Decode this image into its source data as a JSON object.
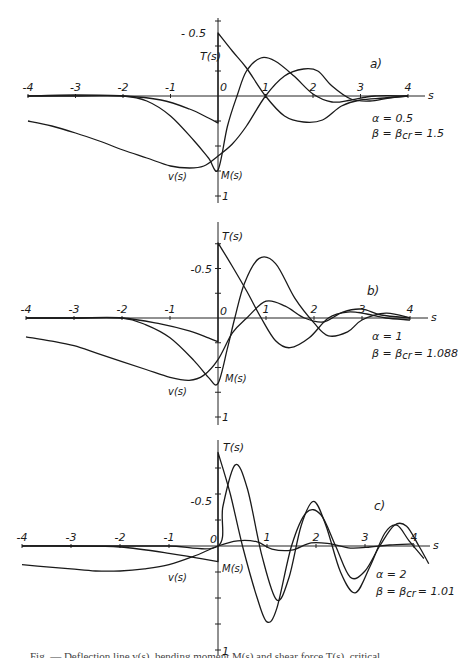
{
  "figure": {
    "caption_partial": "Fig. — Deflection line v(s), bending moment M(s) and shear force T(s), critical"
  },
  "chart_data": [
    {
      "type": "line",
      "panel_label": "a)",
      "xlabel": "s",
      "ylabel": "",
      "x_ticks": [
        "-4",
        "-3",
        "-2",
        "-1",
        "0",
        "1",
        "2",
        "3",
        "4"
      ],
      "y_tick_labels": [
        "-0.5",
        "1"
      ],
      "xlim": [
        -4,
        4.3
      ],
      "ylim": [
        -0.75,
        1.0
      ],
      "y_axis_inverted": true,
      "params": [
        "α = 0.5",
        "β = β_cr = 1.5"
      ],
      "curve_labels": {
        "T": "T(s)",
        "M": "M(s)",
        "v": "v(s)"
      },
      "series": [
        {
          "name": "T(s)",
          "points": [
            [
              -4,
              0.0
            ],
            [
              -3,
              0.0
            ],
            [
              -2,
              0.0
            ],
            [
              -1.2,
              0.04
            ],
            [
              -0.6,
              0.13
            ],
            [
              -0.2,
              0.22
            ],
            [
              0,
              0.27
            ],
            [
              0,
              -0.63
            ],
            [
              0.3,
              -0.45
            ],
            [
              0.6,
              -0.28
            ],
            [
              1.0,
              0.0
            ],
            [
              1.4,
              0.2
            ],
            [
              1.8,
              0.26
            ],
            [
              2.2,
              0.24
            ],
            [
              2.6,
              0.1
            ],
            [
              3.0,
              0.04
            ],
            [
              3.5,
              0.02
            ],
            [
              4.0,
              0.0
            ]
          ]
        },
        {
          "name": "M(s)",
          "points": [
            [
              -4,
              0.0
            ],
            [
              -3,
              -0.01
            ],
            [
              -2,
              0.0
            ],
            [
              -1.5,
              0.05
            ],
            [
              -1.0,
              0.2
            ],
            [
              -0.5,
              0.45
            ],
            [
              -0.2,
              0.62
            ],
            [
              0,
              0.74
            ],
            [
              0.2,
              0.3
            ],
            [
              0.4,
              0.0
            ],
            [
              0.6,
              -0.25
            ],
            [
              0.9,
              -0.38
            ],
            [
              1.2,
              -0.35
            ],
            [
              1.6,
              -0.2
            ],
            [
              2.0,
              -0.02
            ],
            [
              2.4,
              0.06
            ],
            [
              2.8,
              0.04
            ],
            [
              3.3,
              0.0
            ],
            [
              4.0,
              0.0
            ]
          ]
        },
        {
          "name": "v(s)",
          "points": [
            [
              -4,
              0.25
            ],
            [
              -3.5,
              0.3
            ],
            [
              -3,
              0.37
            ],
            [
              -2.5,
              0.45
            ],
            [
              -2,
              0.54
            ],
            [
              -1.5,
              0.62
            ],
            [
              -1,
              0.7
            ],
            [
              -0.6,
              0.72
            ],
            [
              -0.3,
              0.7
            ],
            [
              0,
              0.6
            ],
            [
              0.3,
              0.48
            ],
            [
              0.6,
              0.3
            ],
            [
              1.0,
              0.0
            ],
            [
              1.4,
              -0.2
            ],
            [
              1.8,
              -0.27
            ],
            [
              2.1,
              -0.25
            ],
            [
              2.4,
              -0.1
            ],
            [
              2.8,
              0.03
            ],
            [
              3.2,
              0.05
            ],
            [
              3.6,
              0.02
            ],
            [
              4.0,
              0.0
            ]
          ]
        }
      ]
    },
    {
      "type": "line",
      "panel_label": "b)",
      "xlabel": "s",
      "ylabel": "",
      "x_ticks": [
        "-4",
        "-3",
        "-2",
        "-1",
        "0",
        "1",
        "2",
        "3",
        "4"
      ],
      "y_tick_labels": [
        "-0.5",
        "1"
      ],
      "xlim": [
        -4,
        4.3
      ],
      "ylim": [
        -0.9,
        1.0
      ],
      "y_axis_inverted": true,
      "params": [
        "α = 1",
        "β = β_cr = 1.088"
      ],
      "curve_labels": {
        "T": "T(s)",
        "M": "M(s)",
        "v": "v(s)"
      },
      "series": [
        {
          "name": "T(s)",
          "points": [
            [
              -4,
              0.0
            ],
            [
              -3,
              0.0
            ],
            [
              -2,
              0.0
            ],
            [
              -1.2,
              0.06
            ],
            [
              -0.6,
              0.13
            ],
            [
              -0.2,
              0.2
            ],
            [
              0,
              0.24
            ],
            [
              0,
              -0.76
            ],
            [
              0.3,
              -0.52
            ],
            [
              0.6,
              -0.27
            ],
            [
              0.9,
              0.0
            ],
            [
              1.2,
              0.23
            ],
            [
              1.5,
              0.3
            ],
            [
              1.9,
              0.2
            ],
            [
              2.3,
              0.0
            ],
            [
              2.7,
              -0.06
            ],
            [
              3.1,
              -0.04
            ],
            [
              3.5,
              0.0
            ],
            [
              4.0,
              0.02
            ]
          ]
        },
        {
          "name": "M(s)",
          "points": [
            [
              -4,
              0.0
            ],
            [
              -3,
              0.0
            ],
            [
              -2,
              0.0
            ],
            [
              -1.5,
              0.07
            ],
            [
              -1.0,
              0.2
            ],
            [
              -0.5,
              0.43
            ],
            [
              -0.2,
              0.6
            ],
            [
              0,
              0.66
            ],
            [
              0.2,
              0.3
            ],
            [
              0.35,
              0.0
            ],
            [
              0.55,
              -0.35
            ],
            [
              0.85,
              -0.6
            ],
            [
              1.2,
              -0.55
            ],
            [
              1.6,
              -0.2
            ],
            [
              2.0,
              0.05
            ],
            [
              2.3,
              0.18
            ],
            [
              2.7,
              0.14
            ],
            [
              3.0,
              0.02
            ],
            [
              3.5,
              -0.05
            ],
            [
              4.0,
              0.0
            ]
          ]
        },
        {
          "name": "v(s)",
          "points": [
            [
              -4,
              0.19
            ],
            [
              -3.5,
              0.23
            ],
            [
              -3,
              0.28
            ],
            [
              -2.5,
              0.36
            ],
            [
              -2,
              0.44
            ],
            [
              -1.5,
              0.52
            ],
            [
              -1,
              0.6
            ],
            [
              -0.6,
              0.63
            ],
            [
              -0.3,
              0.58
            ],
            [
              0,
              0.42
            ],
            [
              0.3,
              0.15
            ],
            [
              0.6,
              0.0
            ],
            [
              1.0,
              -0.17
            ],
            [
              1.4,
              -0.12
            ],
            [
              1.8,
              0.0
            ],
            [
              2.2,
              0.04
            ],
            [
              2.6,
              -0.06
            ],
            [
              3.0,
              -0.09
            ],
            [
              3.4,
              -0.03
            ],
            [
              4.0,
              0.0
            ]
          ]
        }
      ]
    },
    {
      "type": "line",
      "panel_label": "c)",
      "xlabel": "s",
      "ylabel": "",
      "x_ticks": [
        "-4",
        "-3",
        "-2",
        "-1",
        "0",
        "1",
        "2",
        "3",
        "4"
      ],
      "y_tick_labels": [
        "-0.5",
        "1"
      ],
      "xlim": [
        -4,
        4.3
      ],
      "ylim": [
        -0.95,
        1.0
      ],
      "y_axis_inverted": true,
      "params": [
        "α = 2",
        "β = β_cr = 1.01"
      ],
      "curve_labels": {
        "T": "T(s)",
        "M": "M(s)",
        "v": "v(s)"
      },
      "series": [
        {
          "name": "T(s)",
          "points": [
            [
              -4,
              0.0
            ],
            [
              -3,
              0.0
            ],
            [
              -2,
              0.01
            ],
            [
              -1,
              0.07
            ],
            [
              -0.5,
              0.11
            ],
            [
              0,
              0.15
            ],
            [
              0,
              -0.9
            ],
            [
              0.25,
              -0.5
            ],
            [
              0.5,
              0.0
            ],
            [
              0.8,
              0.5
            ],
            [
              1.0,
              0.73
            ],
            [
              1.2,
              0.6
            ],
            [
              1.5,
              0.0
            ],
            [
              1.8,
              -0.32
            ],
            [
              2.1,
              -0.3
            ],
            [
              2.4,
              0.0
            ],
            [
              2.7,
              0.3
            ],
            [
              3.0,
              0.24
            ],
            [
              3.3,
              0.0
            ],
            [
              3.6,
              -0.2
            ],
            [
              3.85,
              -0.19
            ],
            [
              4.1,
              0.0
            ],
            [
              4.3,
              0.17
            ]
          ]
        },
        {
          "name": "M(s)",
          "points": [
            [
              -4,
              0.0
            ],
            [
              -3,
              0.0
            ],
            [
              -2,
              0.0
            ],
            [
              -1,
              0.0
            ],
            [
              0,
              0.0
            ],
            [
              0.1,
              -0.38
            ],
            [
              0.35,
              -0.78
            ],
            [
              0.6,
              -0.55
            ],
            [
              0.9,
              0.1
            ],
            [
              1.2,
              0.52
            ],
            [
              1.45,
              0.3
            ],
            [
              1.7,
              -0.2
            ],
            [
              1.95,
              -0.43
            ],
            [
              2.2,
              -0.2
            ],
            [
              2.5,
              0.25
            ],
            [
              2.8,
              0.45
            ],
            [
              3.1,
              0.2
            ],
            [
              3.4,
              -0.12
            ],
            [
              3.65,
              -0.2
            ],
            [
              3.9,
              -0.05
            ],
            [
              4.2,
              0.12
            ]
          ]
        },
        {
          "name": "v(s)",
          "points": [
            [
              -4,
              0.18
            ],
            [
              -3.5,
              0.2
            ],
            [
              -3,
              0.22
            ],
            [
              -2.5,
              0.24
            ],
            [
              -2,
              0.24
            ],
            [
              -1.5,
              0.22
            ],
            [
              -1,
              0.18
            ],
            [
              -0.5,
              0.1
            ],
            [
              0,
              0.0
            ],
            [
              0.4,
              -0.05
            ],
            [
              0.8,
              -0.04
            ],
            [
              1.1,
              0.03
            ],
            [
              1.5,
              0.04
            ],
            [
              1.9,
              -0.03
            ],
            [
              2.3,
              -0.02
            ],
            [
              2.7,
              0.02
            ],
            [
              3.1,
              0.01
            ],
            [
              3.5,
              -0.01
            ],
            [
              4.0,
              -0.02
            ]
          ]
        }
      ]
    }
  ],
  "panels": [
    {
      "label": "a)",
      "alpha": "α = 0.5",
      "beta": "β = β",
      "beta_sub": "cr",
      "beta_val": "= 1.5",
      "T_label": "T(s)",
      "M_label": "M(s)",
      "v_label": "v(s)",
      "y_top_label": "- 0.5",
      "y_zero_label": "0",
      "y_bottom_label": "1",
      "x_axis_label": "s"
    },
    {
      "label": "b)",
      "alpha": "α = 1",
      "beta": "β = β",
      "beta_sub": "cr",
      "beta_val": "= 1.088",
      "T_label": "T(s)",
      "M_label": "M(s)",
      "v_label": "v(s)",
      "y_top_label": "-0.5",
      "y_zero_label": "0",
      "y_bottom_label": "1",
      "x_axis_label": "s"
    },
    {
      "label": "c)",
      "alpha": "α = 2",
      "beta": "β = β",
      "beta_sub": "cr",
      "beta_val": "= 1.01",
      "T_label": "T(s)",
      "M_label": "M(s)",
      "v_label": "v(s)",
      "y_top_label": "-0.5",
      "y_zero_label": "0",
      "y_bottom_label": "1",
      "x_axis_label": "s"
    }
  ],
  "layout": {
    "panels": [
      {
        "x0": 218,
        "ux": 47.5,
        "y0": 96,
        "uy": 100,
        "xstart": 27,
        "xend": 425,
        "ytop": 18,
        "ybot": 203
      },
      {
        "x0": 218,
        "ux": 48,
        "y0": 318,
        "uy": 99,
        "xstart": 27,
        "xend": 428,
        "ytop": 222,
        "ybot": 425
      },
      {
        "x0": 218,
        "ux": 49,
        "y0": 546,
        "uy": 104,
        "xstart": 30,
        "xend": 430,
        "ytop": 440,
        "ybot": 655
      }
    ]
  }
}
